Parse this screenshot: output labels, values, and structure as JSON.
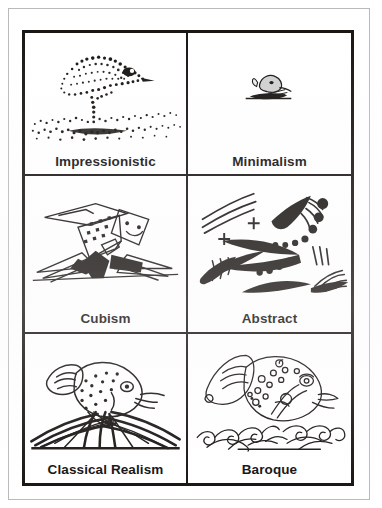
{
  "document": {
    "type": "scanned-illustration-grid",
    "subject": "fish drawn in six art styles",
    "columns": 2,
    "rows": 3,
    "background_color": "#ffffff",
    "ink_color": "#15110f",
    "outer_rule_color": "#b9b9b9"
  },
  "cells": [
    {
      "id": "impressionistic",
      "label": "Impressionistic",
      "art_name": "stippled-fish-illustration",
      "description": "fish rendered entirely in dense ink stipple dots over a speckled ground"
    },
    {
      "id": "minimalism",
      "label": "Minimalism",
      "art_name": "tiny-fish-illustration",
      "description": "very small simple fish over a few grass strokes"
    },
    {
      "id": "cubism",
      "label": "Cubism",
      "art_name": "geometric-fish-illustration",
      "description": "angular faceted fish with smiling square head, dotted body planes and flat grass shards"
    },
    {
      "id": "abstract",
      "label": "Abstract",
      "art_name": "abstract-fish-illustration",
      "description": "black wedge and brush strokes, plus signs, scattered dots and speed lines"
    },
    {
      "id": "classical-realism",
      "label": "Classical Realism",
      "art_name": "realistic-fish-illustration",
      "description": "shaded fish with spotted body leaping above dense grass blades"
    },
    {
      "id": "baroque",
      "label": "Baroque",
      "art_name": "ornate-fish-illustration",
      "description": "outlined fish covered in swirls and circles over curling ornamental scrollwork"
    }
  ]
}
